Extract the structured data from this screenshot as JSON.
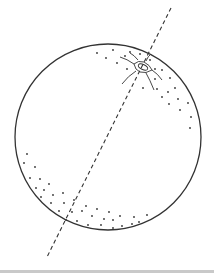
{
  "figure": {
    "colors": {
      "stroke": "#333333",
      "background": "#ffffff",
      "bottom_strip": "#c9c9c9"
    },
    "sphere": {
      "cx": 108,
      "cy": 137,
      "r": 93
    },
    "axis": {
      "x1": 171,
      "y1": 8,
      "x2": 47,
      "y2": 257,
      "dash": "4 3"
    },
    "navel": {
      "cx": 143,
      "cy": 67
    }
  }
}
